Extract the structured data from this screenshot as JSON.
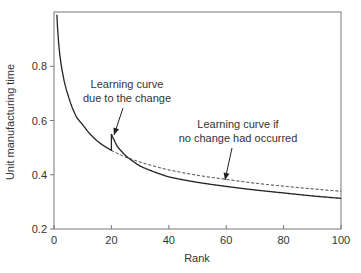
{
  "chart_data": {
    "type": "line",
    "title": "",
    "xlabel": "Rank",
    "ylabel": "Unit manufacturing time",
    "xlim": [
      0,
      100
    ],
    "ylim": [
      0.2,
      1.0
    ],
    "xticks": [
      0,
      20,
      40,
      60,
      80,
      100
    ],
    "xtick_labels": [
      "0",
      "20",
      "40",
      "60",
      "80",
      "100"
    ],
    "yticks": [
      0.2,
      0.4,
      0.6,
      0.8
    ],
    "ytick_labels": [
      "0.2",
      "0.4",
      "0.6",
      "0.8"
    ],
    "grid": false,
    "legend": null,
    "series": [
      {
        "name": "Learning curve due to the change",
        "style": "solid",
        "color": "#222222",
        "x": [
          1,
          2,
          3,
          5,
          8,
          10,
          15,
          20,
          20,
          22,
          25,
          30,
          40,
          50,
          60,
          70,
          80,
          90,
          100
        ],
        "y": [
          0.99,
          0.845,
          0.775,
          0.69,
          0.61,
          0.585,
          0.525,
          0.49,
          0.55,
          0.505,
          0.47,
          0.432,
          0.392,
          0.372,
          0.357,
          0.344,
          0.333,
          0.322,
          0.313
        ]
      },
      {
        "name": "Learning curve if no change had occurred",
        "style": "dashed",
        "color": "#222222",
        "x": [
          20,
          25,
          30,
          40,
          50,
          60,
          70,
          80,
          90,
          100
        ],
        "y": [
          0.49,
          0.465,
          0.447,
          0.418,
          0.398,
          0.383,
          0.369,
          0.358,
          0.348,
          0.339
        ]
      }
    ],
    "annotations": [
      {
        "text_lines": [
          "Learning curve",
          "due to the change"
        ],
        "text_pos": {
          "x": 127,
          "y1": 88,
          "y2": 102
        },
        "arrow_from": {
          "x": 123,
          "y": 108
        },
        "arrow_to": {
          "x": 114,
          "y": 135
        }
      },
      {
        "text_lines": [
          "Learning curve if",
          "no change had occurred"
        ],
        "text_pos": {
          "x": 238,
          "y1": 128,
          "y2": 142
        },
        "arrow_from": {
          "x": 232,
          "y": 148
        },
        "arrow_to": {
          "x": 225,
          "y": 180
        }
      }
    ]
  },
  "plot": {
    "frame": {
      "left": 54,
      "top": 12,
      "right": 341,
      "bottom": 229
    },
    "axis_color": "#666666",
    "line_color": "#222222"
  }
}
